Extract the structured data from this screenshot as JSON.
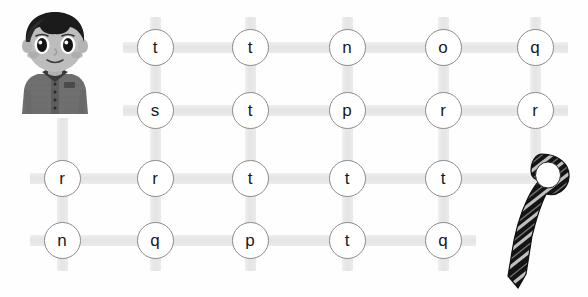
{
  "worksheet": {
    "type": "letter-maze-path-puzzle",
    "title": "",
    "character": {
      "name": "schoolboy-character",
      "description": "cartoon boy with dark hair wearing grey school shirt",
      "hair_color": "#1c1c1c",
      "skin_color": "#b9b9b9",
      "shirt_color": "#707070"
    },
    "goal_object": {
      "name": "striped-necktie",
      "description": "dark necktie with diagonal light stripes",
      "color": "#1a1a1a",
      "stripe_color": "#c9c9c9"
    },
    "grid": {
      "rows": 4,
      "columns": 5,
      "connector_color": "#e6e6e6",
      "circle_border_color": "#8b8b8b",
      "circle_fill": "#ffffff",
      "letter_color": "#1a1a1a",
      "row_labels": [
        "row-1",
        "row-2",
        "row-3",
        "row-4"
      ],
      "letters": [
        [
          "t",
          "t",
          "n",
          "o",
          "q"
        ],
        [
          "s",
          "t",
          "p",
          "r",
          "r"
        ],
        [
          "r",
          "r",
          "t",
          "t",
          "t"
        ],
        [
          "n",
          "q",
          "p",
          "t",
          "q"
        ]
      ],
      "nodes": [
        {
          "id": "r1c2",
          "letter": "t",
          "x": 155,
          "y": 47
        },
        {
          "id": "r1c3",
          "letter": "t",
          "x": 250,
          "y": 47
        },
        {
          "id": "r1c4",
          "letter": "n",
          "x": 347,
          "y": 47
        },
        {
          "id": "r1c5",
          "letter": "o",
          "x": 443,
          "y": 47
        },
        {
          "id": "r1c6",
          "letter": "q",
          "x": 535,
          "y": 47
        },
        {
          "id": "r2c2",
          "letter": "s",
          "x": 155,
          "y": 110
        },
        {
          "id": "r2c3",
          "letter": "t",
          "x": 250,
          "y": 110
        },
        {
          "id": "r2c4",
          "letter": "p",
          "x": 347,
          "y": 110
        },
        {
          "id": "r2c5",
          "letter": "r",
          "x": 443,
          "y": 110
        },
        {
          "id": "r2c6",
          "letter": "r",
          "x": 535,
          "y": 110
        },
        {
          "id": "r3c1",
          "letter": "r",
          "x": 62,
          "y": 178
        },
        {
          "id": "r3c2",
          "letter": "r",
          "x": 155,
          "y": 178
        },
        {
          "id": "r3c3",
          "letter": "t",
          "x": 250,
          "y": 178
        },
        {
          "id": "r3c4",
          "letter": "t",
          "x": 347,
          "y": 178
        },
        {
          "id": "r3c5",
          "letter": "t",
          "x": 443,
          "y": 178
        },
        {
          "id": "r4c1",
          "letter": "n",
          "x": 62,
          "y": 240
        },
        {
          "id": "r4c2",
          "letter": "q",
          "x": 155,
          "y": 240
        },
        {
          "id": "r4c3",
          "letter": "p",
          "x": 250,
          "y": 240
        },
        {
          "id": "r4c4",
          "letter": "t",
          "x": 347,
          "y": 240
        },
        {
          "id": "r4c5",
          "letter": "q",
          "x": 443,
          "y": 240
        }
      ]
    }
  }
}
